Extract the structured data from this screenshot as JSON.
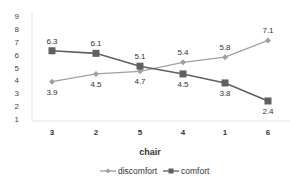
{
  "chart_data": {
    "type": "line",
    "title": "",
    "xlabel": "chair",
    "ylabel": "",
    "categories": [
      "3",
      "2",
      "5",
      "4",
      "1",
      "6"
    ],
    "yticks": [
      "1",
      "2",
      "3",
      "4",
      "5",
      "6",
      "7",
      "8",
      "9"
    ],
    "ylim": [
      1,
      9
    ],
    "grid": false,
    "legend_position": "bottom",
    "series": [
      {
        "name": "discomfort",
        "marker": "diamond",
        "color": "#a0a0a0",
        "values": [
          3.9,
          4.5,
          4.7,
          5.4,
          5.8,
          7.1
        ],
        "labels": [
          "3.9",
          "4.5",
          "4.7",
          "5.4",
          "5.8",
          "7.1"
        ]
      },
      {
        "name": "comfort",
        "marker": "square",
        "color": "#606060",
        "values": [
          6.3,
          6.1,
          5.1,
          4.5,
          3.8,
          2.4
        ],
        "labels": [
          "6.3",
          "6.1",
          "5.1",
          "4.5",
          "3.8",
          "2.4"
        ]
      }
    ]
  }
}
